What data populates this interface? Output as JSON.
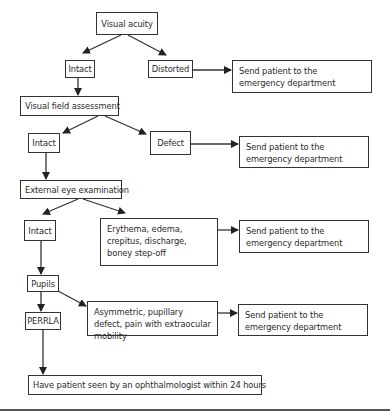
{
  "diagram": {
    "type": "flowchart",
    "nodes": {
      "visual_acuity": "Visual acuity",
      "intact_1": "Intact",
      "distorted": "Distorted",
      "send_1": "Send patient to the emergency department",
      "visual_field": "Visual field assessment",
      "intact_2": "Intact",
      "defect": "Defect",
      "send_2": "Send patient to the emergency department",
      "external_eye": "External eye examination",
      "intact_3": "Intact",
      "erythema": "Erythema, edema, crepitus, discharge, boney step-off",
      "send_3": "Send patient to the emergency department",
      "pupils": "Pupils",
      "perrla": "PERRLA",
      "asymmetric": "Asymmetric, pupillary defect, pain with extraocular mobility",
      "send_4": "Send patient to the emergency department",
      "final": "Have patient seen by an ophthalmologist within 24 hours"
    },
    "edges": [
      [
        "visual_acuity",
        "intact_1"
      ],
      [
        "visual_acuity",
        "distorted"
      ],
      [
        "distorted",
        "send_1"
      ],
      [
        "intact_1",
        "visual_field"
      ],
      [
        "visual_field",
        "intact_2"
      ],
      [
        "visual_field",
        "defect"
      ],
      [
        "defect",
        "send_2"
      ],
      [
        "intact_2",
        "external_eye"
      ],
      [
        "external_eye",
        "intact_3"
      ],
      [
        "external_eye",
        "erythema"
      ],
      [
        "erythema",
        "send_3"
      ],
      [
        "intact_3",
        "pupils"
      ],
      [
        "pupils",
        "perrla"
      ],
      [
        "pupils",
        "asymmetric"
      ],
      [
        "asymmetric",
        "send_4"
      ],
      [
        "perrla",
        "final"
      ]
    ]
  }
}
